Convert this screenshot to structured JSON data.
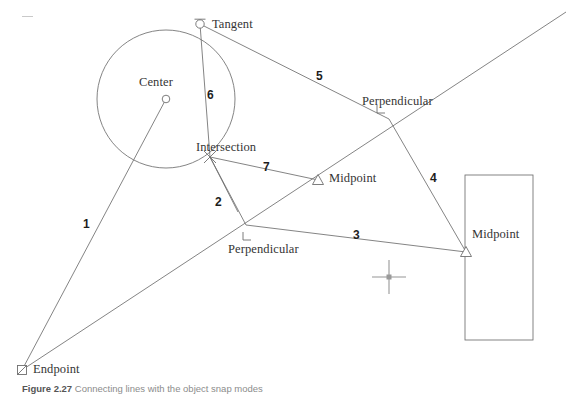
{
  "figure": {
    "background_color": "#ffffff",
    "line_color": "#6e6e6e",
    "marker_color": "#6e6e6e",
    "text_color": "#343434",
    "cursor": {
      "name": "crosshair-cursor",
      "x": 389,
      "y": 277,
      "arm": 17,
      "color": "#b5b5b5"
    }
  },
  "circle": {
    "cx": 166,
    "cy": 99,
    "r": 69,
    "center_marker": {
      "x": 166,
      "y": 99,
      "type": "circle-marker"
    }
  },
  "rectangle": {
    "x": 465,
    "y": 175,
    "width": 68,
    "height": 165
  },
  "points": {
    "tangent": {
      "x": 200,
      "y": 24,
      "marker": "tangent-marker"
    },
    "center": {
      "x": 166,
      "y": 99,
      "marker": "center-marker"
    },
    "intersection": {
      "x": 210,
      "y": 157,
      "marker": "intersection-marker"
    },
    "perpendicular_upper": {
      "x": 389,
      "y": 119,
      "marker": "perpendicular-marker"
    },
    "perpendicular_lower": {
      "x": 246,
      "y": 225,
      "marker": "perpendicular-marker"
    },
    "midpoint_middle": {
      "x": 318,
      "y": 180,
      "marker": "midpoint-marker"
    },
    "midpoint_right": {
      "x": 466,
      "y": 252,
      "marker": "midpoint-marker"
    },
    "endpoint": {
      "x": 22,
      "y": 370,
      "marker": "endpoint-marker"
    }
  },
  "osnap_labels": [
    {
      "id": "tangent",
      "text": "Tangent",
      "x": 212,
      "y": 18
    },
    {
      "id": "center",
      "text": "Center",
      "x": 139,
      "y": 76
    },
    {
      "id": "intersection",
      "text": "Intersection",
      "x": 196,
      "y": 141
    },
    {
      "id": "perpendicular-upper",
      "text": "Perpendicular",
      "x": 362,
      "y": 95
    },
    {
      "id": "midpoint-middle",
      "text": "Midpoint",
      "x": 329,
      "y": 172
    },
    {
      "id": "perpendicular-lower",
      "text": "Perpendicular",
      "x": 228,
      "y": 243
    },
    {
      "id": "midpoint-right",
      "text": "Midpoint",
      "x": 472,
      "y": 228
    },
    {
      "id": "endpoint",
      "text": "Endpoint",
      "x": 33,
      "y": 363
    }
  ],
  "segment_numbers": [
    {
      "id": "1",
      "text": "1",
      "x": 83,
      "y": 218
    },
    {
      "id": "2",
      "text": "2",
      "x": 215,
      "y": 196
    },
    {
      "id": "3",
      "text": "3",
      "x": 353,
      "y": 229
    },
    {
      "id": "4",
      "text": "4",
      "x": 430,
      "y": 172
    },
    {
      "id": "5",
      "text": "5",
      "x": 316,
      "y": 70
    },
    {
      "id": "6",
      "text": "6",
      "x": 207,
      "y": 89
    },
    {
      "id": "7",
      "text": "7",
      "x": 263,
      "y": 161
    }
  ],
  "caption": {
    "figure_label": "Figure 2.27",
    "rest": "Connecting lines with the object snap modes"
  }
}
